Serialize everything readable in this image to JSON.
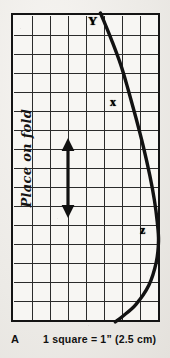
{
  "figure": {
    "letter": "A",
    "scale_caption": "1 square = 1” (2.5 cm)",
    "fold_note": "Place on fold"
  },
  "grid": {
    "columns": 8,
    "rows": 16,
    "square_size_inches": 1,
    "square_size_cm": 2.5,
    "border_color": "#141414",
    "line_color": "#2b2b2b",
    "paper_color": "#f7f6f3"
  },
  "points": [
    {
      "id": "point-y",
      "label": "Y"
    },
    {
      "id": "point-x",
      "label": "x"
    },
    {
      "id": "point-z",
      "label": "z"
    }
  ],
  "annotations": {
    "arrow": {
      "name": "double-headed-arrow",
      "orientation": "vertical",
      "spans_squares": 3
    }
  },
  "chart_data": {
    "type": "line",
    "xlabel": "grid squares (horizontal)",
    "ylabel": "grid squares (vertical)",
    "xlim": [
      0,
      8
    ],
    "ylim": [
      0,
      16
    ],
    "grid": true,
    "legend": "none",
    "series": [
      {
        "name": "cutting-edge",
        "comment": "Curve traced from Y at top edge, bulging right past x and z, returning to the bottom edge.",
        "x": [
          4.8,
          5.0,
          5.4,
          5.9,
          6.3,
          6.7,
          7.1,
          7.45,
          7.7,
          7.85,
          7.92,
          7.8,
          7.4,
          6.7,
          6.0,
          5.6
        ],
        "y": [
          16.0,
          15.55,
          14.6,
          13.3,
          12.0,
          10.6,
          9.1,
          7.6,
          6.3,
          5.2,
          4.2,
          3.1,
          1.9,
          0.9,
          0.3,
          0.0
        ]
      }
    ],
    "annotations": [
      {
        "label": "Y",
        "x": 4.7,
        "y": 15.85
      },
      {
        "label": "x",
        "x": 6.05,
        "y": 11.7
      },
      {
        "label": "z",
        "x": 7.7,
        "y": 5.1
      }
    ]
  }
}
